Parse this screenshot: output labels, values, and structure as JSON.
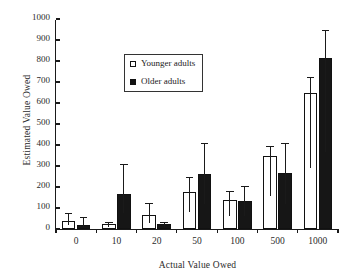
{
  "chart_data": {
    "type": "bar",
    "title": "",
    "xlabel": "Actual Value Owed",
    "ylabel": "Estimated Value Owed",
    "categories": [
      "0",
      "10",
      "20",
      "50",
      "100",
      "500",
      "1000"
    ],
    "ylim": [
      0,
      1000
    ],
    "yticks": [
      0,
      100,
      200,
      300,
      400,
      500,
      600,
      700,
      800,
      900,
      1000
    ],
    "grid": false,
    "legend_position": "top-left-inside",
    "series": [
      {
        "name": "Younger adults",
        "color": "#ffffff",
        "edge_color": "#111111",
        "values": [
          40,
          22,
          68,
          178,
          140,
          348,
          648
        ],
        "errors_upper": [
          38,
          10,
          54,
          72,
          40,
          48,
          78
        ]
      },
      {
        "name": "Older adults",
        "color": "#161616",
        "edge_color": "#111111",
        "values": [
          18,
          165,
          25,
          263,
          135,
          265,
          812
        ],
        "errors_upper": [
          40,
          145,
          8,
          147,
          68,
          143,
          138
        ]
      }
    ]
  },
  "legend": {
    "items": [
      {
        "label": "Younger adults",
        "style": "hollow"
      },
      {
        "label": "Older adults",
        "style": "solid"
      }
    ]
  }
}
